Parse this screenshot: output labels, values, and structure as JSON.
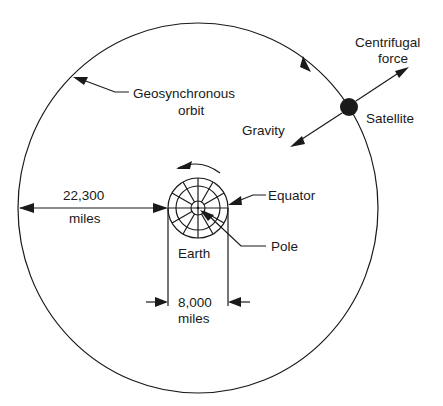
{
  "diagram": {
    "labels": {
      "orbit_line1": "Geosynchronous",
      "orbit_line2": "orbit",
      "centrifugal_line1": "Centrifugal",
      "centrifugal_line2": "force",
      "satellite": "Satellite",
      "gravity": "Gravity",
      "equator": "Equator",
      "pole": "Pole",
      "earth": "Earth",
      "distance_value": "22,300",
      "distance_unit": "miles",
      "diameter_value": "8,000",
      "diameter_unit": "miles"
    },
    "colors": {
      "line": "#1a1a1a",
      "background": "#ffffff"
    }
  }
}
